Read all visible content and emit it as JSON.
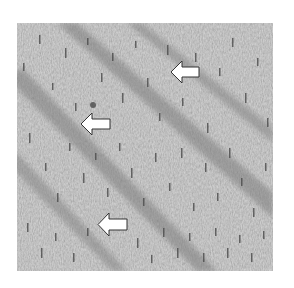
{
  "figure": {
    "background_color": "#a9a9a9",
    "band_color": "#8e8e8e",
    "arrows": [
      {
        "direction": "left",
        "x": 153,
        "y": 37,
        "w": 30,
        "h": 24
      },
      {
        "direction": "left",
        "x": 63,
        "y": 89,
        "w": 31,
        "h": 24
      },
      {
        "direction": "left",
        "x": 80,
        "y": 189,
        "w": 31,
        "h": 25
      }
    ]
  }
}
